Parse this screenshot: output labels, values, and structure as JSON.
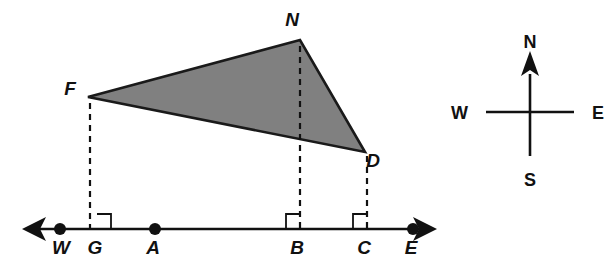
{
  "figure": {
    "background_color": "#ffffff",
    "ink_color": "#111111",
    "triangle_fill_color": "#808080",
    "triangle_stroke_color": "#1a1a1a",
    "baseline": {
      "name": "line-we",
      "left_arrow": "arrow-left",
      "right_arrow": "arrow-right",
      "y": 229,
      "x_start": 27,
      "x_end": 430
    },
    "points": [
      {
        "id": "W",
        "label": "W",
        "x": 60,
        "y": 229,
        "has_dot": true,
        "label_x": 57,
        "label_y": 254
      },
      {
        "id": "G",
        "label": "G",
        "x": 97,
        "y": 229,
        "has_dot": false,
        "label_x": 91,
        "label_y": 254
      },
      {
        "id": "A",
        "label": "A",
        "x": 155,
        "y": 229,
        "has_dot": true,
        "label_x": 149,
        "label_y": 254
      },
      {
        "id": "B",
        "label": "B",
        "x": 300,
        "y": 229,
        "has_dot": false,
        "label_x": 293,
        "label_y": 254
      },
      {
        "id": "C",
        "label": "C",
        "x": 367,
        "y": 229,
        "has_dot": false,
        "label_x": 360,
        "label_y": 254
      },
      {
        "id": "E",
        "label": "E",
        "x": 413,
        "y": 229,
        "has_dot": true,
        "label_x": 407,
        "label_y": 254
      }
    ],
    "triangle": {
      "name": "triangle-fnd",
      "vertices": [
        {
          "id": "F",
          "label": "F",
          "x": 88,
          "y": 97,
          "label_x": 70,
          "label_y": 95
        },
        {
          "id": "N",
          "label": "N",
          "x": 300,
          "y": 40,
          "label_x": 292,
          "label_y": 26
        },
        {
          "id": "D",
          "label": "D",
          "x": 365,
          "y": 152,
          "label_x": 373,
          "label_y": 167
        }
      ]
    },
    "perpendiculars": [
      {
        "name": "dashed-f-to-g",
        "from": "F",
        "to": "G",
        "x": 90,
        "y_top": 103,
        "y_bottom": 228,
        "square_side": "right"
      },
      {
        "name": "dashed-n-to-b",
        "from": "N",
        "to": "B",
        "x": 300,
        "y_top": 46,
        "y_bottom": 228,
        "square_side": "left"
      },
      {
        "name": "dashed-d-to-c",
        "from": "D",
        "to": "C",
        "x": 367,
        "y_top": 156,
        "y_bottom": 228,
        "square_side": "left"
      }
    ],
    "right_angle_squares": [
      {
        "name": "right-angle-marker-g",
        "at": "G",
        "size": 14,
        "side": "right"
      },
      {
        "name": "right-angle-marker-b",
        "at": "B",
        "size": 14,
        "side": "left"
      },
      {
        "name": "right-angle-marker-c",
        "at": "C",
        "size": 14,
        "side": "left"
      }
    ]
  },
  "compass": {
    "name": "compass-rose",
    "center_x": 530,
    "center_y": 112,
    "arm_length": 44,
    "north_has_arrow": true,
    "directions": {
      "north": "N",
      "south": "S",
      "east": "E",
      "west": "W"
    },
    "label_positions": {
      "north": {
        "x": 530,
        "y": 42
      },
      "south": {
        "x": 530,
        "y": 182
      },
      "east": {
        "x": 594,
        "y": 119
      },
      "west": {
        "x": 466,
        "y": 119
      }
    }
  }
}
